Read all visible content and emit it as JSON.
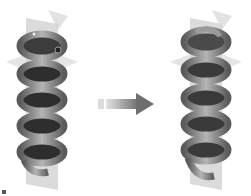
{
  "figure": {
    "left": {
      "label": "",
      "coil_turns": 5,
      "state": "before"
    },
    "right": {
      "label": "",
      "coil_turns": 5,
      "state": "after"
    },
    "arrow": {
      "direction": "right",
      "color": "#7a7a7a"
    },
    "colors": {
      "coil": "#8c8c8c",
      "coil_dark": "#3a3a3a",
      "plane": "#c8c8c8",
      "background": "#ffffff"
    }
  }
}
